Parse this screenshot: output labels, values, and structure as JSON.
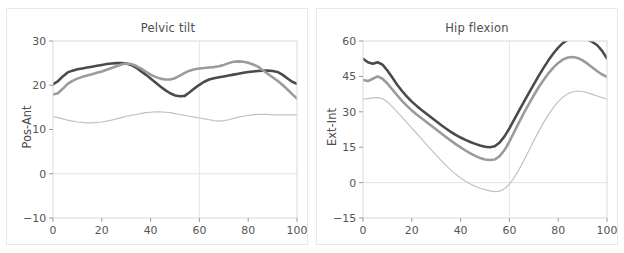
{
  "figure": {
    "background_color": "#ffffff",
    "panel_border_color": "#e8e8e8",
    "text_color": "#4d4d4d"
  },
  "colors": {
    "series_dark": "#4a4a4a",
    "series_mid": "#9b9b9b",
    "series_light": "#c2c2c2",
    "grid": "#e3e3e3",
    "frame": "#d9d9d9"
  },
  "chart_data": [
    {
      "type": "line",
      "title": "Pelvic tilt",
      "xlabel": "",
      "ylabel": "Pos-Ant",
      "xlim": [
        0,
        100
      ],
      "ylim": [
        -10,
        30
      ],
      "xticks": [
        0,
        20,
        40,
        60,
        80,
        100
      ],
      "yticks": [
        -10,
        0,
        10,
        20,
        30
      ],
      "xtick_labels": [
        "0",
        "20",
        "40",
        "60",
        "80",
        "100"
      ],
      "ytick_labels": [
        "-10",
        "0",
        "10",
        "20",
        "30"
      ],
      "grid": true,
      "gridlines_y": [
        0
      ],
      "reference_line_x": 60,
      "legend": "none",
      "x": [
        0,
        2,
        4,
        6,
        8,
        10,
        12,
        14,
        16,
        18,
        20,
        22,
        24,
        26,
        28,
        30,
        32,
        34,
        36,
        38,
        40,
        42,
        44,
        46,
        48,
        50,
        52,
        54,
        56,
        58,
        60,
        62,
        64,
        66,
        68,
        70,
        72,
        74,
        76,
        78,
        80,
        82,
        84,
        86,
        88,
        90,
        92,
        94,
        96,
        98,
        100
      ],
      "series": [
        {
          "name": "dark",
          "color": "#4a4a4a",
          "width": 2.6,
          "values": [
            20.2,
            20.9,
            22.0,
            22.9,
            23.3,
            23.6,
            23.8,
            24.0,
            24.2,
            24.4,
            24.6,
            24.8,
            24.9,
            25.0,
            25.0,
            24.9,
            24.6,
            24.0,
            23.2,
            22.4,
            21.5,
            20.6,
            19.7,
            18.9,
            18.2,
            17.7,
            17.5,
            17.6,
            18.4,
            19.3,
            20.1,
            20.8,
            21.3,
            21.6,
            21.8,
            22.0,
            22.2,
            22.4,
            22.6,
            22.8,
            23.0,
            23.1,
            23.2,
            23.3,
            23.3,
            23.2,
            23.0,
            22.4,
            21.6,
            20.8,
            20.3
          ]
        },
        {
          "name": "mid",
          "color": "#9b9b9b",
          "width": 2.6,
          "values": [
            17.9,
            18.2,
            19.2,
            20.3,
            21.0,
            21.5,
            21.9,
            22.2,
            22.5,
            22.8,
            23.1,
            23.5,
            23.9,
            24.3,
            24.7,
            24.9,
            24.8,
            24.4,
            23.8,
            23.1,
            22.4,
            21.9,
            21.5,
            21.3,
            21.3,
            21.6,
            22.2,
            22.8,
            23.3,
            23.6,
            23.8,
            23.9,
            24.0,
            24.1,
            24.3,
            24.6,
            25.0,
            25.3,
            25.4,
            25.3,
            25.1,
            24.7,
            24.2,
            23.4,
            22.6,
            21.8,
            21.0,
            20.1,
            19.1,
            18.0,
            17.0
          ]
        },
        {
          "name": "light",
          "color": "#c2c2c2",
          "width": 1.2,
          "values": [
            12.9,
            12.7,
            12.4,
            12.1,
            11.9,
            11.7,
            11.6,
            11.5,
            11.5,
            11.6,
            11.7,
            11.9,
            12.1,
            12.4,
            12.7,
            13.0,
            13.2,
            13.4,
            13.6,
            13.8,
            13.9,
            14.0,
            14.0,
            13.9,
            13.8,
            13.6,
            13.4,
            13.2,
            13.0,
            12.8,
            12.6,
            12.4,
            12.2,
            12.0,
            11.9,
            12.0,
            12.2,
            12.5,
            12.8,
            13.0,
            13.2,
            13.3,
            13.4,
            13.4,
            13.4,
            13.3,
            13.3,
            13.3,
            13.3,
            13.3,
            13.3
          ]
        }
      ]
    },
    {
      "type": "line",
      "title": "Hip flexion",
      "xlabel": "",
      "ylabel": "Ext-Int",
      "xlim": [
        0,
        100
      ],
      "ylim": [
        -15,
        60
      ],
      "xticks": [
        0,
        20,
        40,
        60,
        80,
        100
      ],
      "yticks": [
        -15,
        0,
        15,
        30,
        45,
        60
      ],
      "xtick_labels": [
        "0",
        "20",
        "40",
        "60",
        "80",
        "100"
      ],
      "ytick_labels": [
        "-15",
        "0",
        "15",
        "30",
        "45",
        "60"
      ],
      "grid": true,
      "gridlines_y": [
        0
      ],
      "reference_line_x": 60,
      "legend": "none",
      "x": [
        0,
        2,
        4,
        6,
        8,
        10,
        12,
        14,
        16,
        18,
        20,
        22,
        24,
        26,
        28,
        30,
        32,
        34,
        36,
        38,
        40,
        42,
        44,
        46,
        48,
        50,
        52,
        54,
        56,
        58,
        60,
        62,
        64,
        66,
        68,
        70,
        72,
        74,
        76,
        78,
        80,
        82,
        84,
        86,
        88,
        90,
        92,
        94,
        96,
        98,
        100
      ],
      "series": [
        {
          "name": "dark",
          "color": "#4a4a4a",
          "width": 2.6,
          "values": [
            52.5,
            51.0,
            50.4,
            51.0,
            50.0,
            47.5,
            44.5,
            41.5,
            38.8,
            36.4,
            34.3,
            32.5,
            30.8,
            29.2,
            27.6,
            26.0,
            24.4,
            22.9,
            21.5,
            20.2,
            19.1,
            18.1,
            17.2,
            16.4,
            15.7,
            15.2,
            15.0,
            15.4,
            17.0,
            19.6,
            23.0,
            26.8,
            30.6,
            34.3,
            38.0,
            41.6,
            45.2,
            48.6,
            51.8,
            54.7,
            57.2,
            59.2,
            60.6,
            61.4,
            61.6,
            61.3,
            60.6,
            59.6,
            58.2,
            55.8,
            52.6
          ]
        },
        {
          "name": "mid",
          "color": "#9b9b9b",
          "width": 2.6,
          "values": [
            43.5,
            43.0,
            44.0,
            45.0,
            44.0,
            42.0,
            39.5,
            37.0,
            34.6,
            32.5,
            30.6,
            28.9,
            27.3,
            25.7,
            24.1,
            22.5,
            20.9,
            19.3,
            17.8,
            16.3,
            14.9,
            13.6,
            12.4,
            11.3,
            10.4,
            9.8,
            9.6,
            9.8,
            11.2,
            13.8,
            17.4,
            21.5,
            25.6,
            29.6,
            33.4,
            37.0,
            40.4,
            43.5,
            46.3,
            48.7,
            50.7,
            52.2,
            53.0,
            53.2,
            52.8,
            51.8,
            50.4,
            48.8,
            47.2,
            45.8,
            44.8
          ]
        },
        {
          "name": "light",
          "color": "#c2c2c2",
          "width": 1.2,
          "values": [
            35.5,
            35.6,
            35.9,
            36.0,
            35.6,
            34.2,
            32.2,
            30.0,
            27.7,
            25.4,
            23.1,
            20.8,
            18.5,
            16.2,
            13.9,
            11.6,
            9.4,
            7.3,
            5.3,
            3.5,
            1.9,
            0.6,
            -0.6,
            -1.6,
            -2.4,
            -3.0,
            -3.5,
            -3.8,
            -3.6,
            -2.6,
            -0.7,
            2.1,
            5.6,
            9.5,
            13.6,
            17.7,
            21.7,
            25.4,
            28.8,
            31.8,
            34.3,
            36.3,
            37.7,
            38.5,
            38.8,
            38.6,
            38.1,
            37.4,
            36.7,
            36.0,
            35.4
          ]
        }
      ]
    }
  ]
}
